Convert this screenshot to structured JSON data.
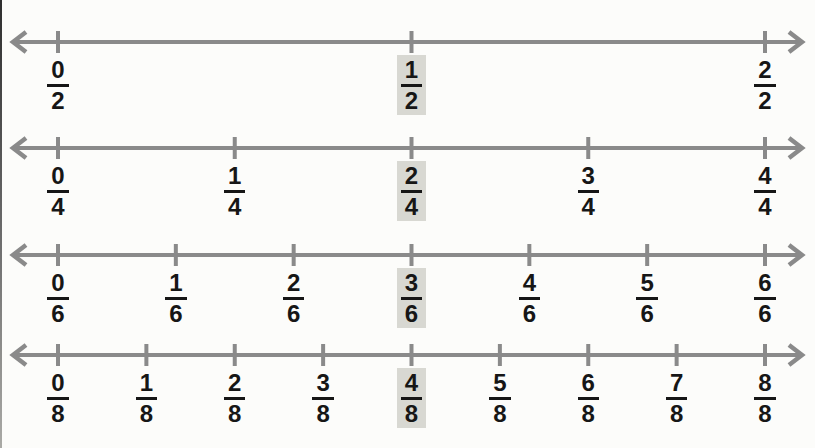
{
  "colors": {
    "line": "#8a8a8a",
    "text": "#161616",
    "highlight": "#d8d8d2",
    "background": "#fcfcfa"
  },
  "number_lines": [
    {
      "name": "halves",
      "denominator": 2,
      "fractions": [
        {
          "numerator": "0",
          "denominator": "2",
          "highlighted": false
        },
        {
          "numerator": "1",
          "denominator": "2",
          "highlighted": true
        },
        {
          "numerator": "2",
          "denominator": "2",
          "highlighted": false
        }
      ]
    },
    {
      "name": "fourths",
      "denominator": 4,
      "fractions": [
        {
          "numerator": "0",
          "denominator": "4",
          "highlighted": false
        },
        {
          "numerator": "1",
          "denominator": "4",
          "highlighted": false
        },
        {
          "numerator": "2",
          "denominator": "4",
          "highlighted": true
        },
        {
          "numerator": "3",
          "denominator": "4",
          "highlighted": false
        },
        {
          "numerator": "4",
          "denominator": "4",
          "highlighted": false
        }
      ]
    },
    {
      "name": "sixths",
      "denominator": 6,
      "fractions": [
        {
          "numerator": "0",
          "denominator": "6",
          "highlighted": false
        },
        {
          "numerator": "1",
          "denominator": "6",
          "highlighted": false
        },
        {
          "numerator": "2",
          "denominator": "6",
          "highlighted": false
        },
        {
          "numerator": "3",
          "denominator": "6",
          "highlighted": true
        },
        {
          "numerator": "4",
          "denominator": "6",
          "highlighted": false
        },
        {
          "numerator": "5",
          "denominator": "6",
          "highlighted": false
        },
        {
          "numerator": "6",
          "denominator": "6",
          "highlighted": false
        }
      ]
    },
    {
      "name": "eighths",
      "denominator": 8,
      "fractions": [
        {
          "numerator": "0",
          "denominator": "8",
          "highlighted": false
        },
        {
          "numerator": "1",
          "denominator": "8",
          "highlighted": false
        },
        {
          "numerator": "2",
          "denominator": "8",
          "highlighted": false
        },
        {
          "numerator": "3",
          "denominator": "8",
          "highlighted": false
        },
        {
          "numerator": "4",
          "denominator": "8",
          "highlighted": true
        },
        {
          "numerator": "5",
          "denominator": "8",
          "highlighted": false
        },
        {
          "numerator": "6",
          "denominator": "8",
          "highlighted": false
        },
        {
          "numerator": "7",
          "denominator": "8",
          "highlighted": false
        },
        {
          "numerator": "8",
          "denominator": "8",
          "highlighted": false
        }
      ]
    }
  ]
}
